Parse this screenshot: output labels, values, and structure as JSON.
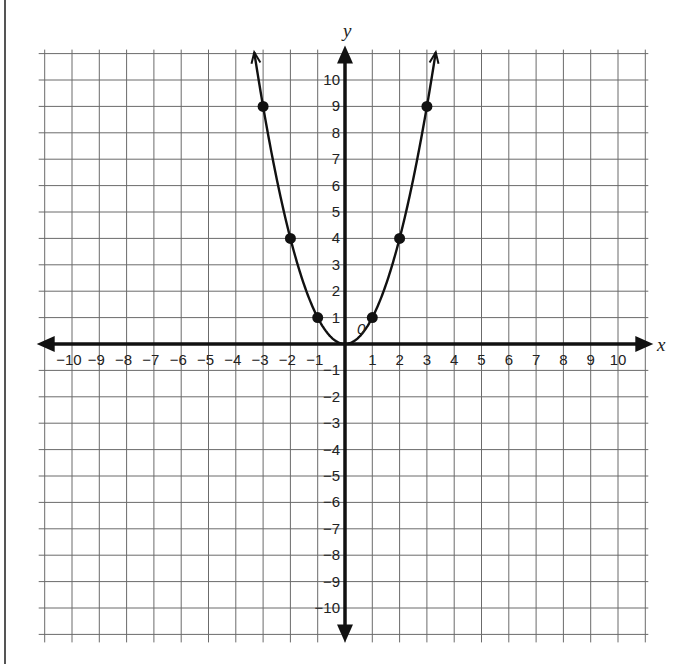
{
  "chart_data": {
    "type": "scatter",
    "title": "",
    "xlabel": "x",
    "ylabel": "y",
    "xlim": [
      -11,
      11
    ],
    "ylim": [
      -11,
      11
    ],
    "grid": true,
    "x_ticks": [
      -10,
      -9,
      -8,
      -7,
      -6,
      -5,
      -4,
      -3,
      -2,
      -1,
      1,
      2,
      3,
      4,
      5,
      6,
      7,
      8,
      9,
      10
    ],
    "y_ticks": [
      -10,
      -9,
      -8,
      -7,
      -6,
      -5,
      -4,
      -3,
      -2,
      -1,
      1,
      2,
      3,
      4,
      5,
      6,
      7,
      8,
      9,
      10
    ],
    "origin_label": "0",
    "series": [
      {
        "name": "y = x^2",
        "type": "line",
        "curve": "parabola",
        "arrows_at_ends": true,
        "x": [
          -3,
          -2,
          -1,
          0,
          1,
          2,
          3
        ],
        "y": [
          9,
          4,
          1,
          0,
          1,
          4,
          9
        ]
      },
      {
        "name": "plotted points",
        "type": "scatter",
        "x": [
          -3,
          -2,
          -1,
          1,
          2,
          3
        ],
        "y": [
          9,
          4,
          1,
          1,
          4,
          9
        ]
      }
    ]
  },
  "labels": {
    "x_axis": "x",
    "y_axis": "y",
    "origin": "0"
  },
  "colors": {
    "grid": "#6b6b6b",
    "axis": "#111111",
    "curve": "#111111",
    "points": "#111111"
  }
}
